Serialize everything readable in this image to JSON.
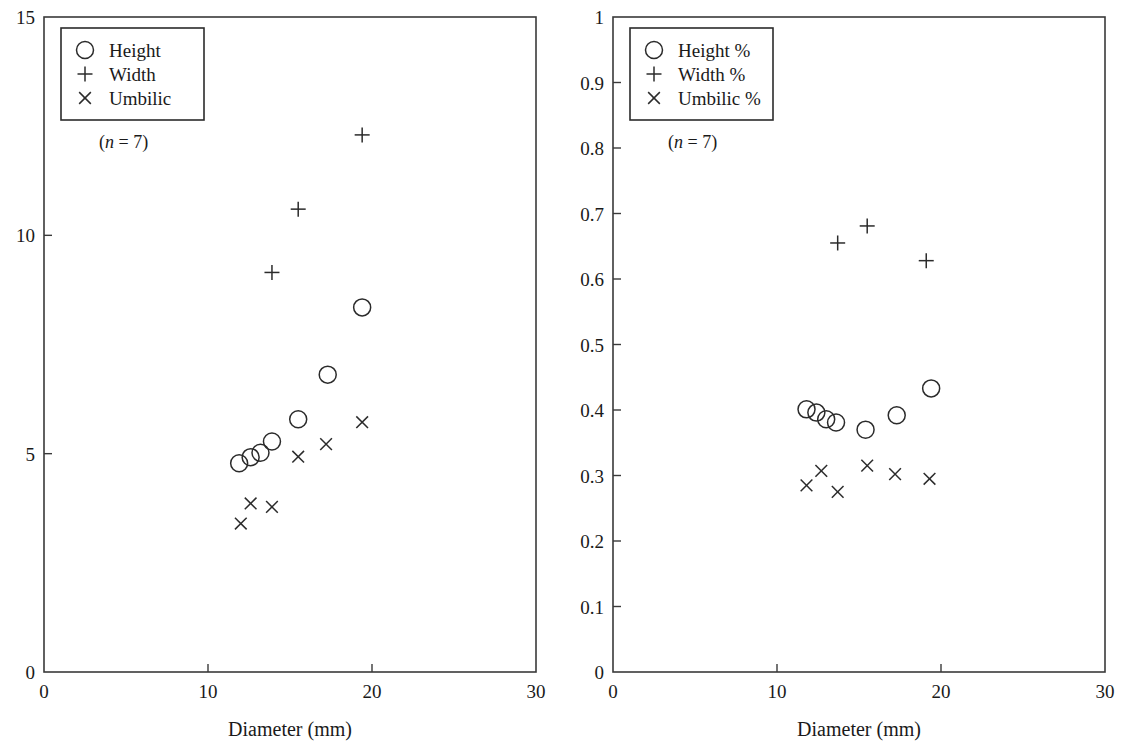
{
  "figure": {
    "background": "#ffffff",
    "ink_color": "#1a1a1a",
    "marker_color": "#2b2b2b",
    "axis_color": "#3a3a3a"
  },
  "chart_data": [
    {
      "panel": "left",
      "type": "scatter",
      "title": "",
      "xlabel": "Diameter (mm)",
      "ylabel": "",
      "xlim": [
        0,
        30
      ],
      "ylim": [
        0,
        15
      ],
      "xticks": [
        0,
        10,
        20,
        30
      ],
      "xticklabels": [
        "0",
        "10",
        "20",
        "30"
      ],
      "yticks": [
        0,
        5,
        10,
        15
      ],
      "yticklabels": [
        "0",
        "5",
        "10",
        "15"
      ],
      "grid": false,
      "legend_position": "upper-left",
      "annotation": "(n = 7)",
      "annotation_parts": {
        "open": "(",
        "italic": "n",
        "rest": " = 7)"
      },
      "series": [
        {
          "name": "Height",
          "marker": "circle",
          "x": [
            11.9,
            12.6,
            13.2,
            13.9,
            15.5,
            17.3,
            19.4
          ],
          "y": [
            4.78,
            4.92,
            5.02,
            5.28,
            5.79,
            6.81,
            8.35
          ]
        },
        {
          "name": "Width",
          "marker": "plus",
          "x": [
            13.9,
            15.5,
            19.4
          ],
          "y": [
            9.15,
            10.6,
            12.3
          ]
        },
        {
          "name": "Umbilic",
          "marker": "cross",
          "x": [
            12.0,
            12.6,
            13.9,
            15.5,
            17.2,
            19.4
          ],
          "y": [
            3.4,
            3.86,
            3.78,
            4.93,
            5.22,
            5.72
          ]
        }
      ]
    },
    {
      "panel": "right",
      "type": "scatter",
      "title": "",
      "xlabel": "Diameter (mm)",
      "ylabel": "",
      "xlim": [
        0,
        30
      ],
      "ylim": [
        0,
        1
      ],
      "xticks": [
        0,
        10,
        20,
        30
      ],
      "xticklabels": [
        "0",
        "10",
        "20",
        "30"
      ],
      "yticks": [
        0,
        0.1,
        0.2,
        0.3,
        0.4,
        0.5,
        0.6,
        0.7,
        0.8,
        0.9,
        1
      ],
      "yticklabels": [
        "0",
        "0.1",
        "0.2",
        "0.3",
        "0.4",
        "0.5",
        "0.6",
        "0.7",
        "0.8",
        "0.9",
        "1"
      ],
      "grid": false,
      "legend_position": "upper-left",
      "annotation": "(n = 7)",
      "annotation_parts": {
        "open": "(",
        "italic": "n",
        "rest": " = 7)"
      },
      "series": [
        {
          "name": "Height %",
          "marker": "circle",
          "x": [
            11.8,
            12.4,
            13.0,
            13.6,
            15.4,
            17.3,
            19.4
          ],
          "y": [
            0.401,
            0.396,
            0.386,
            0.381,
            0.37,
            0.392,
            0.433
          ]
        },
        {
          "name": "Width %",
          "marker": "plus",
          "x": [
            13.7,
            15.5,
            19.1
          ],
          "y": [
            0.655,
            0.681,
            0.628
          ]
        },
        {
          "name": "Umbilic %",
          "marker": "cross",
          "x": [
            11.8,
            12.7,
            13.7,
            15.5,
            17.2,
            19.3
          ],
          "y": [
            0.285,
            0.307,
            0.275,
            0.315,
            0.302,
            0.295
          ]
        }
      ]
    }
  ],
  "panels": [
    {
      "id": "left",
      "legend": {
        "items": [
          {
            "marker": "circle",
            "label": "Height"
          },
          {
            "marker": "plus",
            "label": "Width"
          },
          {
            "marker": "cross",
            "label": "Umbilic"
          }
        ]
      }
    },
    {
      "id": "right",
      "legend": {
        "items": [
          {
            "marker": "circle",
            "label": "Height %"
          },
          {
            "marker": "plus",
            "label": "Width %"
          },
          {
            "marker": "cross",
            "label": "Umbilic %"
          }
        ]
      }
    }
  ]
}
